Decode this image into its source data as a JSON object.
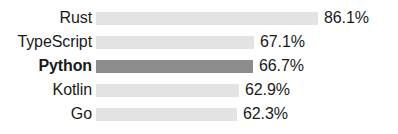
{
  "chart_data": {
    "type": "bar",
    "orientation": "horizontal",
    "title": "",
    "subtitle": "",
    "xlabel": "",
    "ylabel": "",
    "grid": false,
    "legend": false,
    "legend_position": "none",
    "axis_visible": false,
    "xlim": [
      0,
      100
    ],
    "unit": "%",
    "categories": [
      "Rust",
      "TypeScript",
      "Python",
      "Kotlin",
      "Go"
    ],
    "values": [
      86.1,
      67.1,
      66.7,
      62.9,
      62.3
    ],
    "value_labels": [
      "86.1%",
      "67.1%",
      "66.7%",
      "62.9%",
      "62.3%"
    ],
    "highlight_category": "Python",
    "colors": {
      "bar": "#e3e3e3",
      "bar_highlight": "#8c8c8c",
      "text": "#1a1a1a",
      "background": "#ffffff"
    },
    "bars": [
      {
        "label": "Rust",
        "value": 86.1,
        "value_label": "86.1%",
        "highlight": false,
        "bar_px": 222
      },
      {
        "label": "TypeScript",
        "value": 67.1,
        "value_label": "67.1%",
        "highlight": false,
        "bar_px": 158
      },
      {
        "label": "Python",
        "value": 66.7,
        "value_label": "66.7%",
        "highlight": true,
        "bar_px": 157
      },
      {
        "label": "Kotlin",
        "value": 62.9,
        "value_label": "62.9%",
        "highlight": false,
        "bar_px": 143
      },
      {
        "label": "Go",
        "value": 62.3,
        "value_label": "62.3%",
        "highlight": false,
        "bar_px": 141
      }
    ]
  }
}
